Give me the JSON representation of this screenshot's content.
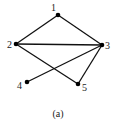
{
  "diagram": {
    "caption": "(a)",
    "colors": {
      "edge": "#111111",
      "node": "#000000",
      "text": "#222222",
      "background": "#ffffff"
    },
    "nodes": [
      {
        "id": "1",
        "label": "1",
        "x": 58,
        "y": 15,
        "lx": 51,
        "ly": 11
      },
      {
        "id": "2",
        "label": "2",
        "x": 16,
        "y": 44,
        "lx": 7,
        "ly": 48
      },
      {
        "id": "3",
        "label": "3",
        "x": 102,
        "y": 45,
        "lx": 105,
        "ly": 49
      },
      {
        "id": "4",
        "label": "4",
        "x": 27,
        "y": 82,
        "lx": 17,
        "ly": 89
      },
      {
        "id": "5",
        "label": "5",
        "x": 78,
        "y": 84,
        "lx": 82,
        "ly": 91
      }
    ],
    "edges": [
      {
        "from": "1",
        "to": "2"
      },
      {
        "from": "1",
        "to": "3"
      },
      {
        "from": "2",
        "to": "3"
      },
      {
        "from": "2",
        "to": "5"
      },
      {
        "from": "3",
        "to": "4"
      },
      {
        "from": "3",
        "to": "5"
      }
    ]
  }
}
